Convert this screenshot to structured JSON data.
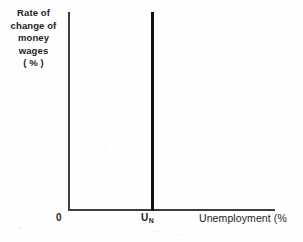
{
  "chart_data": {
    "type": "line",
    "title": "",
    "subtitle": "",
    "ylabel_lines": [
      "Rate of",
      "change of",
      "money",
      "wages",
      "( % )"
    ],
    "ylabel": "Rate of change of money wages (%)",
    "xlabel": "Unemployment (%",
    "xlabel_full": "Unemployment (%)",
    "xlabel_clipped": true,
    "origin_label": "0",
    "grid": false,
    "legend": null,
    "xlim": [
      0,
      100
    ],
    "ylim": [
      0,
      100
    ],
    "xticks": [
      {
        "label": "U",
        "subscript": "N",
        "value": 42
      }
    ],
    "yticks": [],
    "series": [
      {
        "name": "Long-run Phillips curve",
        "orientation": "vertical",
        "x": [
          42,
          42
        ],
        "values": [
          0,
          100
        ],
        "color": "#111111",
        "linewidth": 3
      }
    ],
    "annotations": []
  },
  "axes": {
    "y_axis_color": "#3c3c3c",
    "x_axis_color": "#3c3c3c",
    "background": "#fefefe"
  }
}
